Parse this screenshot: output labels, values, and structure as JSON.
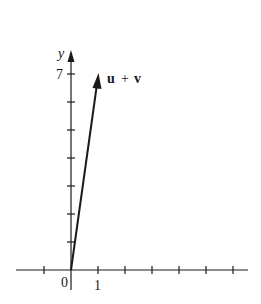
{
  "diagram": {
    "type": "vector-plot",
    "axes": {
      "y_label": "y",
      "y_tick_label": "7",
      "origin_label": "0",
      "x_tick_label": "1"
    },
    "vector": {
      "label_u": "u",
      "label_plus": "+",
      "label_v": "v",
      "from": [
        0,
        0
      ],
      "to": [
        1,
        7
      ]
    },
    "colors": {
      "ink": "#1a1a1a",
      "background": "#ffffff"
    }
  }
}
